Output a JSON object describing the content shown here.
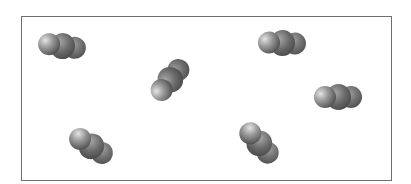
{
  "figure": {
    "colors": {
      "border": "#6e6e6e",
      "atom_highlight": "#e4e4e4",
      "atom_shadow": "#3a3a3a",
      "background": "#ffffff"
    },
    "molecules": [
      {
        "id": "m1",
        "x": 38,
        "y": 33,
        "rotate": 8
      },
      {
        "id": "m2",
        "x": 146,
        "y": 67,
        "rotate": -50
      },
      {
        "id": "m3",
        "x": 258,
        "y": 30,
        "rotate": 2
      },
      {
        "id": "m4",
        "x": 314,
        "y": 84,
        "rotate": 0
      },
      {
        "id": "m5",
        "x": 67,
        "y": 133,
        "rotate": 33
      },
      {
        "id": "m6",
        "x": 235,
        "y": 130,
        "rotate": 48
      }
    ]
  }
}
